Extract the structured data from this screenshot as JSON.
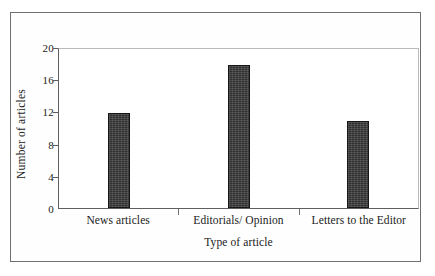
{
  "chart_data": {
    "type": "bar",
    "title": "",
    "categories": [
      "News articles",
      "Editorials/ Opinion",
      "Letters to the Editor"
    ],
    "values": [
      12,
      18,
      11
    ],
    "xlabel": "Type of article",
    "ylabel": "Number of articles",
    "ylim": [
      0,
      20
    ],
    "yticks": [
      0,
      4,
      8,
      12,
      16,
      20
    ],
    "ytick_labels": [
      "0",
      "4",
      "8",
      "12",
      "16",
      "20"
    ],
    "grid": false,
    "legend": "none",
    "bar_color": "#3d3d3d",
    "bar_edge_color": "#161616",
    "axis_color": "#5e5e5e",
    "plot_border_color": "#b9b9b9",
    "frame_color": "#6f6f6f",
    "background": "#ffffff"
  }
}
